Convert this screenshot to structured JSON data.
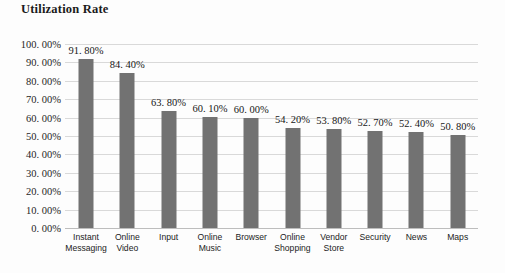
{
  "chart_data": {
    "type": "bar",
    "title": "Utilization Rate",
    "xlabel": "",
    "ylabel": "",
    "ylim": [
      0,
      100
    ],
    "grid": true,
    "legend": "none",
    "orientation": "vertical",
    "bar_color": "#727272",
    "gridline_color": "#d9d9d9",
    "categories": [
      "Instant Messaging",
      "Online Video",
      "Input",
      "Online Music",
      "Browser",
      "Online Shopping",
      "Vendor Store",
      "Security",
      "News",
      "Maps"
    ],
    "values": [
      91.8,
      84.4,
      63.8,
      60.1,
      60.0,
      54.2,
      53.8,
      52.7,
      52.4,
      50.8
    ],
    "value_labels": [
      "91. 80%",
      "84. 40%",
      "63. 80%",
      "60. 10%",
      "60. 00%",
      "54. 20%",
      "53. 80%",
      "52. 70%",
      "52. 40%",
      "50. 80%"
    ],
    "ytick_values": [
      100,
      90,
      80,
      70,
      60,
      50,
      40,
      30,
      20,
      10,
      0
    ],
    "ytick_labels": [
      "100. 00%",
      "90. 00%",
      "80. 00%",
      "70. 00%",
      "60. 00%",
      "50. 00%",
      "40. 00%",
      "30. 00%",
      "20. 00%",
      "10. 00%",
      "0. 00%"
    ]
  }
}
